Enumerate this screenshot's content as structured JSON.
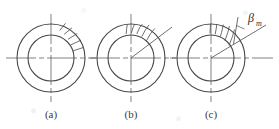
{
  "figure": {
    "type": "engineering-diagram",
    "stroke_color": "#4a4a4a",
    "centerline_color": "#4a4a4a",
    "background": "#ffffff",
    "geometry": {
      "outer_radius": 34,
      "inner_radius": 23,
      "center_y": 58,
      "centers_x": [
        51,
        131,
        211
      ]
    },
    "panels": [
      {
        "id": "a",
        "caption": "(a)",
        "caption_x": 51,
        "caption_y": 115,
        "center_x": 51,
        "hatch_style": "straight-radial",
        "hatch_count": 5,
        "hatch_start_angle_deg": 18,
        "hatch_end_angle_deg": 52,
        "has_lead_line": false,
        "has_angle_label": false
      },
      {
        "id": "b",
        "caption": "(b)",
        "caption_x": 131,
        "caption_y": 115,
        "center_x": 131,
        "hatch_style": "curved",
        "hatch_count": 5,
        "hatch_start_angle_deg": 48,
        "hatch_end_angle_deg": 86,
        "has_lead_line": true,
        "lead_line_angle_deg": 37,
        "lead_line_length": 52,
        "has_angle_label": false
      },
      {
        "id": "c",
        "caption": "(c)",
        "caption_x": 211,
        "caption_y": 115,
        "center_x": 211,
        "hatch_style": "curved",
        "hatch_count": 5,
        "hatch_start_angle_deg": 52,
        "hatch_end_angle_deg": 88,
        "has_lead_line": true,
        "lead_line_angle_deg": 30,
        "lead_line_length": 60,
        "has_angle_label": true,
        "angle_label": "β",
        "angle_label_subscript": "m",
        "angle_label_x": 252,
        "angle_label_y": 22
      }
    ],
    "centerlines": {
      "horizontal_y": 58,
      "horizontal_x_start": 6,
      "horizontal_x_end": 273,
      "vertical_y_start": 14,
      "vertical_y_end": 102
    }
  }
}
